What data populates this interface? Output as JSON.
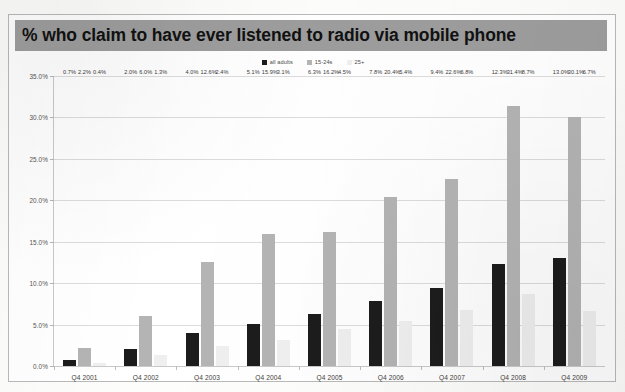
{
  "ghost_top_text": "  ",
  "banner": {
    "title": "% who claim to have ever listened to radio via mobile phone"
  },
  "colors": {
    "banner_bg": "#9d9d9d",
    "series_all_adults": "#1c1c1c",
    "series_15_24s": "#b4b4b4",
    "series_25plus": "#efefef",
    "gridline": "#dcdcdc",
    "frame_border": "#b9b9b9"
  },
  "chart_data": {
    "type": "bar",
    "title": "% who claim to have ever listened to radio via mobile phone",
    "xlabel": "",
    "ylabel": "",
    "ylim": [
      0,
      35
    ],
    "ytick_labels": [
      "0.0%",
      "5.0%",
      "10.0%",
      "15.0%",
      "20.0%",
      "25.0%",
      "30.0%",
      "35.0%"
    ],
    "ytick_values": [
      0,
      5,
      10,
      15,
      20,
      25,
      30,
      35
    ],
    "grid": true,
    "legend_position": "top-center",
    "categories": [
      "Q4 2001",
      "Q4 2002",
      "Q4 2003",
      "Q4 2004",
      "Q4 2005",
      "Q4 2006",
      "Q4 2007",
      "Q4 2008",
      "Q4 2009"
    ],
    "series": [
      {
        "name": "all adults",
        "color": "#1c1c1c",
        "values": [
          0.7,
          2.0,
          4.0,
          5.1,
          6.3,
          7.8,
          9.4,
          12.3,
          13.0
        ],
        "labels": [
          "0.7%",
          "2.0%",
          "4.0%",
          "5.1%",
          "6.3%",
          "7.8%",
          "9.4%",
          "12.3%",
          "13.0%"
        ]
      },
      {
        "name": "15-24s",
        "color": "#b4b4b4",
        "values": [
          2.2,
          6.0,
          12.6,
          15.9,
          16.2,
          20.4,
          22.6,
          31.4,
          30.1
        ],
        "labels": [
          "2.2%",
          "6.0%",
          "12.6%",
          "15.9%",
          "16.2%",
          "20.4%",
          "22.6%",
          "31.4%",
          "30.1%"
        ]
      },
      {
        "name": "25+",
        "color": "#efefef",
        "values": [
          0.4,
          1.3,
          2.4,
          3.1,
          4.5,
          5.4,
          6.8,
          8.7,
          6.7
        ],
        "labels": [
          "0.4%",
          "1.3%",
          "2.4%",
          "3.1%",
          "4.5%",
          "5.4%",
          "6.8%",
          "8.7%",
          "6.7%"
        ]
      }
    ]
  }
}
